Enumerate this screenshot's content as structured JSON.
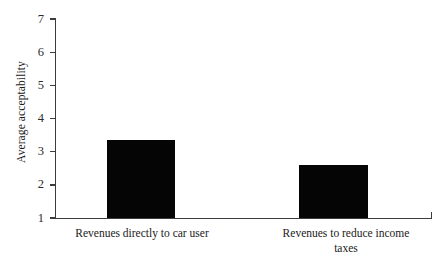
{
  "chart_data": {
    "type": "bar",
    "title": "",
    "xlabel": "",
    "ylabel": "Average acceptability",
    "categories": [
      "Revenues directly to car user",
      "Revenues to reduce income taxes"
    ],
    "values": [
      3.35,
      2.6
    ],
    "ylim": [
      1,
      7
    ],
    "yticks": [
      1,
      2,
      3,
      4,
      5,
      6,
      7
    ],
    "ytick_labels": [
      "1",
      "2",
      "3",
      "4",
      "5",
      "6",
      "7"
    ],
    "grid": false,
    "legend": null,
    "bar_color": "#050505",
    "axis_color": "#3c3c3c",
    "background_color": "#ffffff",
    "series": [
      {
        "name": "Average acceptability",
        "values": [
          3.35,
          2.6
        ]
      }
    ]
  },
  "axis": {
    "y_title": "Average acceptability"
  },
  "category_labels": {
    "first_line_1": "Revenues directly to car user",
    "second_line_1": "Revenues to reduce income",
    "second_line_2": "taxes"
  },
  "ticks": {
    "t1": "1",
    "t2": "2",
    "t3": "3",
    "t4": "4",
    "t5": "5",
    "t6": "6",
    "t7": "7"
  }
}
